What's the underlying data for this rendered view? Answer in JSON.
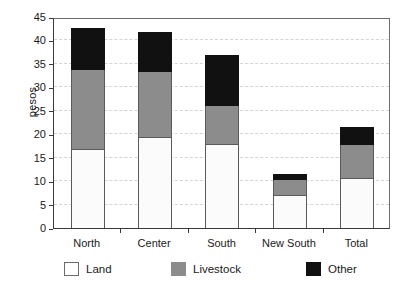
{
  "chart_data": {
    "type": "bar",
    "subtype": "stacked-bar",
    "title": "",
    "xlabel": "",
    "ylabel": "pesos",
    "ylim": [
      0,
      45
    ],
    "ytick_step": 5,
    "yticks": [
      0,
      5,
      10,
      15,
      20,
      25,
      30,
      35,
      40,
      45
    ],
    "grid": true,
    "grid_axis": "y",
    "grid_style": "dashed",
    "legend_position": "bottom",
    "categories": [
      "North",
      "Center",
      "South",
      "New South",
      "Total"
    ],
    "series": [
      {
        "name": "Land",
        "color": "#ffffff",
        "values": [
          16.8,
          19.5,
          17.9,
          7.0,
          10.7
        ]
      },
      {
        "name": "Livestock",
        "color": "#8c8c8c",
        "values": [
          17.0,
          13.8,
          8.1,
          3.3,
          7.1
        ]
      },
      {
        "name": "Other",
        "color": "#111111",
        "values": [
          8.9,
          8.5,
          11.0,
          1.2,
          3.7
        ]
      }
    ],
    "totals": [
      42.7,
      41.8,
      37.0,
      11.5,
      21.5
    ]
  },
  "axis": {
    "ylabel": "pesos"
  },
  "legend": {
    "items": [
      {
        "label": "Land",
        "key": "land"
      },
      {
        "label": "Livestock",
        "key": "livestock"
      },
      {
        "label": "Other",
        "key": "other"
      }
    ]
  }
}
